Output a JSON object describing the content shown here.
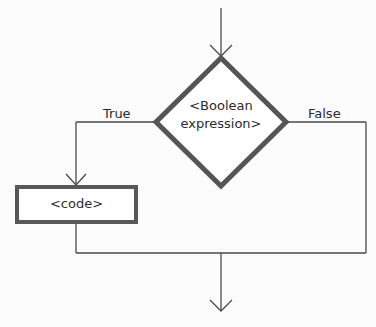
{
  "diagram": {
    "type": "flowchart",
    "decision": {
      "line1": "<Boolean",
      "line2": "expression>"
    },
    "branches": {
      "true_label": "True",
      "false_label": "False"
    },
    "process": {
      "label": "<code>"
    },
    "colors": {
      "stroke": "#4a4a4a",
      "shape_border": "#505050",
      "text": "#2b2b2b",
      "background": "#fcfcfc"
    }
  }
}
